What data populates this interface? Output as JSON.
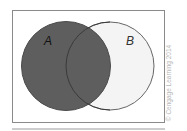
{
  "diagram": {
    "type": "venn",
    "shaded_region": "A",
    "sets": [
      {
        "label": "A",
        "fill": "#5e5e5e"
      },
      {
        "label": "B",
        "fill": "#f4f4f4"
      }
    ],
    "colors": {
      "frame": "#8a8a8a",
      "outline": "#555555",
      "background": "#ffffff"
    }
  },
  "credit": "© Cengage Learning 2014"
}
